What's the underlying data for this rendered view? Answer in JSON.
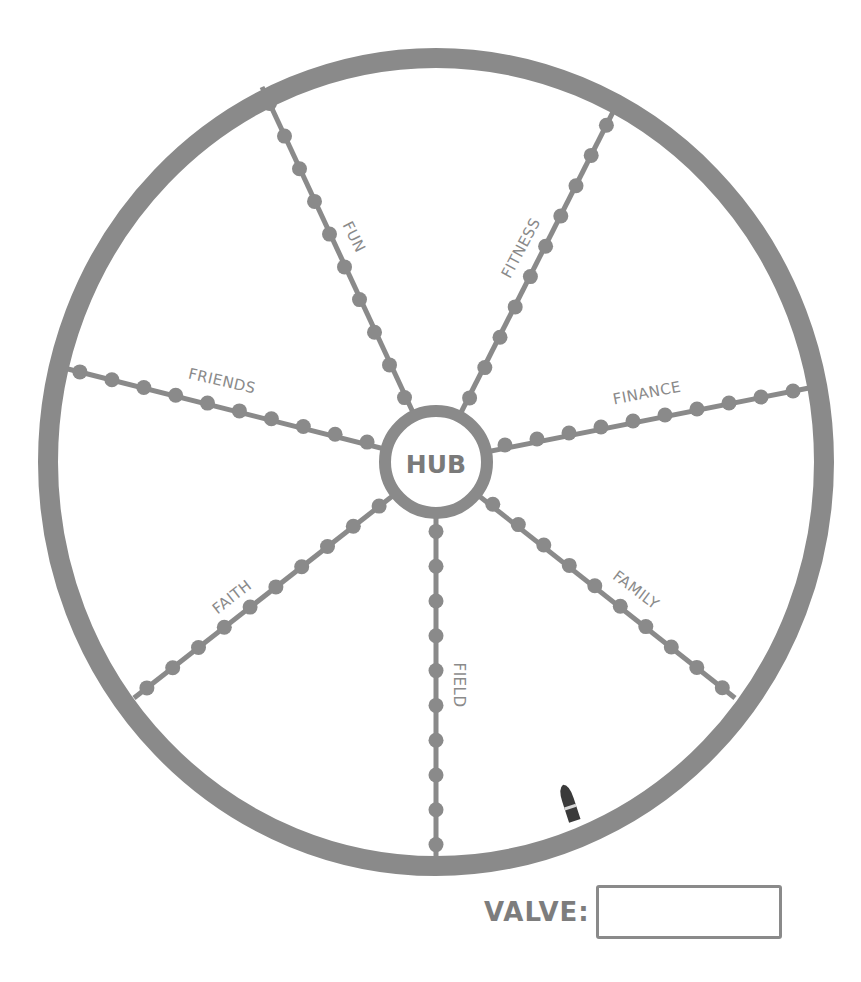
{
  "colors": {
    "stroke": "#8a8a8a",
    "dot": "#8a8a8a",
    "text": "#808080",
    "valve_stem": "#3a3a3a",
    "background": "#ffffff"
  },
  "wheel": {
    "center": [
      436,
      462
    ],
    "rim": {
      "rx": 388,
      "ry": 404,
      "stroke_width": 20
    },
    "hub": {
      "label": "HUB",
      "radius": 51,
      "stroke_width": 12
    },
    "dots_per_spoke": 10,
    "spokes": [
      {
        "label": "FUN",
        "rim_end": [
          262,
          87
        ],
        "hub_end": [
          412,
          414
        ],
        "label_pos": [
          354,
          237
        ],
        "label_rotate": 63
      },
      {
        "label": "FITNESS",
        "rim_end": [
          614,
          110
        ],
        "hub_end": [
          462,
          413
        ],
        "label_pos": [
          521,
          248
        ],
        "label_rotate": -62
      },
      {
        "label": "FRIENDS",
        "rim_end": [
          64,
          368
        ],
        "hub_end": [
          383,
          446
        ],
        "label_pos": [
          222,
          381
        ],
        "label_rotate": 13
      },
      {
        "label": "FINANCE",
        "rim_end": [
          809,
          388
        ],
        "hub_end": [
          489,
          448
        ],
        "label_pos": [
          647,
          393
        ],
        "label_rotate": -11
      },
      {
        "label": "FAITH",
        "rim_end": [
          134,
          698
        ],
        "hub_end": [
          392,
          496
        ],
        "label_pos": [
          232,
          597
        ],
        "label_rotate": -38
      },
      {
        "label": "FIELD",
        "rim_end": [
          436,
          862
        ],
        "hub_end": [
          436,
          514
        ],
        "label_pos": [
          459,
          685
        ],
        "label_rotate": 90
      },
      {
        "label": "FAMILY",
        "rim_end": [
          735,
          698
        ],
        "hub_end": [
          480,
          494
        ],
        "label_pos": [
          636,
          590
        ],
        "label_rotate": 37
      }
    ],
    "valve_stem": {
      "x": 568,
      "y": 800,
      "angle": -18
    }
  },
  "valve": {
    "label": "VALVE:",
    "value": "",
    "placeholder": ""
  }
}
